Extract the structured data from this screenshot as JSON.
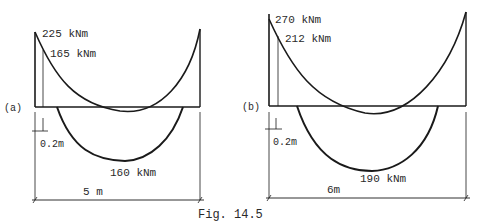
{
  "caption": "Fig. 14.5",
  "panels": [
    {
      "id": "a",
      "tag": "(a)",
      "support_moment": "225 kNm",
      "moment_at_face": "165 kNm",
      "midspan_moment": "160 kNm",
      "face_offset": "0.2m",
      "span": "5 m"
    },
    {
      "id": "b",
      "tag": "(b)",
      "support_moment": "270 kNm",
      "moment_at_face": "212 kNm",
      "midspan_moment": "190 kNm",
      "face_offset": "0.2m",
      "span": "6m"
    }
  ],
  "colors": {
    "ink": "#1a1a1a",
    "background": "#ffffff"
  }
}
